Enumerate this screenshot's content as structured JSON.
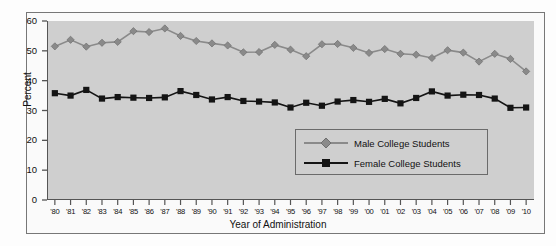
{
  "chart_data": {
    "type": "line",
    "title": "",
    "xlabel": "Year of Administration",
    "ylabel": "Percent",
    "ylim": [
      0,
      60
    ],
    "yticks": [
      0,
      10,
      20,
      30,
      40,
      50,
      60
    ],
    "grid": false,
    "legend_position": "inside-bottom-right",
    "categories": [
      "'80",
      "'81",
      "'82",
      "'83",
      "'84",
      "'85",
      "'86",
      "'87",
      "'88",
      "'89",
      "'90",
      "'91",
      "'92",
      "'93",
      "'94",
      "'95",
      "'96",
      "'97",
      "'98",
      "'99",
      "'00",
      "'01",
      "'02",
      "'03",
      "'04",
      "'05",
      "'06",
      "'07",
      "'08",
      "'09",
      "'10"
    ],
    "series": [
      {
        "name": "Male College Students",
        "marker": "diamond",
        "color": "#8a8a8a",
        "values": [
          51.5,
          53.7,
          51.4,
          52.7,
          53.0,
          56.6,
          56.3,
          57.5,
          55.0,
          53.3,
          52.5,
          51.8,
          49.5,
          49.6,
          52.0,
          50.4,
          48.2,
          52.2,
          52.3,
          51.0,
          49.3,
          50.6,
          49.0,
          48.7,
          47.6,
          50.2,
          49.4,
          46.4,
          49.0,
          47.3,
          43.1
        ]
      },
      {
        "name": "Female College Students",
        "marker": "square",
        "color": "#141414",
        "values": [
          35.8,
          35.0,
          36.9,
          34.0,
          34.5,
          34.3,
          34.2,
          34.4,
          36.5,
          35.2,
          33.7,
          34.5,
          33.2,
          33.0,
          32.7,
          31.0,
          32.6,
          31.6,
          33.0,
          33.5,
          32.9,
          33.9,
          32.4,
          34.2,
          36.4,
          35.0,
          35.3,
          35.2,
          34.0,
          30.9,
          31.0
        ]
      }
    ]
  }
}
